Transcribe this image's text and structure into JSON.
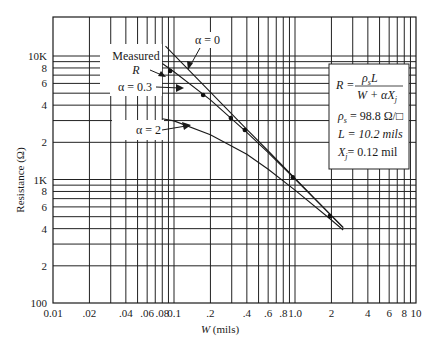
{
  "chart_data": {
    "type": "line",
    "title": "",
    "xlabel": "W (mils)",
    "ylabel": "Resistance (Ω)",
    "xscale": "log",
    "yscale": "log",
    "xlim": [
      0.01,
      10
    ],
    "ylim": [
      100,
      20700
    ],
    "grid": true,
    "x_tick_labels": [
      {
        "v": 0.01,
        "t": "0.01"
      },
      {
        "v": 0.02,
        "t": ".02"
      },
      {
        "v": 0.04,
        "t": ".04"
      },
      {
        "v": 0.06,
        "t": ".06"
      },
      {
        "v": 0.08,
        "t": ".08"
      },
      {
        "v": 0.1,
        "t": "0.1"
      },
      {
        "v": 0.2,
        "t": ".2"
      },
      {
        "v": 0.4,
        "t": ".4"
      },
      {
        "v": 0.6,
        "t": ".6"
      },
      {
        "v": 0.8,
        "t": ".8"
      },
      {
        "v": 1.0,
        "t": "1.0"
      },
      {
        "v": 2,
        "t": "2"
      },
      {
        "v": 4,
        "t": "4"
      },
      {
        "v": 6,
        "t": "6"
      },
      {
        "v": 8,
        "t": "8"
      },
      {
        "v": 10,
        "t": "10"
      }
    ],
    "y_tick_labels": [
      {
        "v": 100,
        "t": "100"
      },
      {
        "v": 200,
        "t": "2"
      },
      {
        "v": 400,
        "t": "4"
      },
      {
        "v": 600,
        "t": "6"
      },
      {
        "v": 800,
        "t": "8"
      },
      {
        "v": 1000,
        "t": "1K"
      },
      {
        "v": 2000,
        "t": "2"
      },
      {
        "v": 4000,
        "t": "4"
      },
      {
        "v": 6000,
        "t": "6"
      },
      {
        "v": 8000,
        "t": "8"
      },
      {
        "v": 10000,
        "t": "10K"
      }
    ],
    "series": [
      {
        "name": "α = 0",
        "style": "line",
        "x": [
          0.085,
          0.1,
          0.2,
          0.4,
          0.6,
          1.0,
          2.0,
          2.5
        ],
        "y": [
          12000,
          10200,
          5100,
          2550,
          1700,
          1020,
          510,
          408
        ]
      },
      {
        "name": "α = 0.3",
        "style": "line",
        "x": [
          0.08,
          0.1,
          0.2,
          0.4,
          0.6,
          1.0,
          2.0,
          2.5
        ],
        "y": [
          8700,
          7450,
          4420,
          2410,
          1650,
          1010,
          510,
          410
        ]
      },
      {
        "name": "α = 2",
        "style": "line",
        "x": [
          0.08,
          0.1,
          0.2,
          0.4,
          0.6,
          1.0,
          2.0,
          2.5
        ],
        "y": [
          3100,
          2980,
          2300,
          1600,
          1210,
          820,
          470,
          390
        ]
      },
      {
        "name": "Measured R",
        "style": "points",
        "x": [
          0.093,
          0.174,
          0.295,
          0.385,
          0.96,
          1.94
        ],
        "y": [
          7560,
          4830,
          3150,
          2520,
          1040,
          505
        ]
      }
    ],
    "annotations": [
      {
        "text": "Measured",
        "sub": "R"
      },
      {
        "text": "α = 0"
      },
      {
        "text": "α = 0.3"
      },
      {
        "text": "α = 2"
      }
    ],
    "legend_box": {
      "formula_lhs": "R =",
      "formula_num": "ρ",
      "formula_num_sub": "s",
      "formula_num_tail": "L",
      "formula_den": "W + αX",
      "formula_den_sub": "j",
      "rho_label": "ρ",
      "rho_sub": "s",
      "rho_value": " = 98.8 Ω/□",
      "L_line": "L = 10.2 mils",
      "xj_label": "X",
      "xj_sub": "j",
      "xj_value": "= 0.12 mil"
    }
  }
}
